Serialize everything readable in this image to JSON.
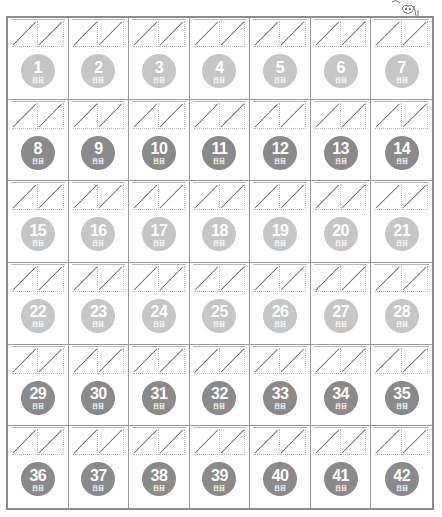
{
  "page": {
    "mascot": "cartoon-character-icon"
  },
  "colors": {
    "light": "#c6c6c6",
    "dark": "#8a8a8a",
    "border": "#8c8c8c"
  },
  "day_suffix": "日目",
  "rows": [
    {
      "tone": "light",
      "days": [
        "1",
        "2",
        "3",
        "4",
        "5",
        "6",
        "7"
      ]
    },
    {
      "tone": "dark",
      "days": [
        "8",
        "9",
        "10",
        "11",
        "12",
        "13",
        "14"
      ]
    },
    {
      "tone": "light",
      "days": [
        "15",
        "16",
        "17",
        "18",
        "19",
        "20",
        "21"
      ]
    },
    {
      "tone": "light",
      "days": [
        "22",
        "23",
        "24",
        "25",
        "26",
        "27",
        "28"
      ]
    },
    {
      "tone": "dark",
      "days": [
        "29",
        "30",
        "31",
        "32",
        "33",
        "34",
        "35"
      ]
    },
    {
      "tone": "dark",
      "days": [
        "36",
        "37",
        "38",
        "39",
        "40",
        "41",
        "42"
      ]
    }
  ]
}
